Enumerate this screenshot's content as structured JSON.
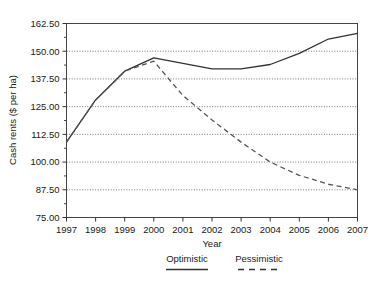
{
  "chart_data": {
    "type": "line",
    "title": "",
    "xlabel": "Year",
    "ylabel": "Cash rents ($ per ha)",
    "x": [
      1997,
      1998,
      1999,
      2000,
      2001,
      2002,
      2003,
      2004,
      2005,
      2006,
      2007
    ],
    "xticklabels": [
      "1997",
      "1998",
      "1999",
      "2000",
      "2001",
      "2002",
      "2003",
      "2004",
      "2005",
      "2006",
      "2007"
    ],
    "yticklabels": [
      "162.50",
      "150.00",
      "137.50",
      "125.00",
      "112.50",
      "100.00",
      "87.50",
      "75.00"
    ],
    "yticks": [
      162.5,
      150.0,
      137.5,
      125.0,
      112.5,
      100.0,
      87.5,
      75.0
    ],
    "ylim": [
      75.0,
      162.5
    ],
    "xlim": [
      1997,
      2007
    ],
    "grid": "horizontal-dotted",
    "legend_position": "below-axis",
    "series": [
      {
        "name": "Optimistic",
        "style": "solid",
        "color": "#333333",
        "values": [
          109.0,
          128.0,
          141.0,
          147.0,
          144.5,
          142.0,
          142.0,
          144.0,
          149.0,
          155.5,
          158.0
        ]
      },
      {
        "name": "Pessimistic",
        "style": "dashed",
        "color": "#555555",
        "values": [
          109.0,
          128.0,
          141.0,
          145.5,
          130.0,
          119.0,
          109.0,
          100.0,
          94.0,
          90.0,
          87.5
        ]
      }
    ]
  },
  "legend": {
    "items": [
      {
        "label": "Optimistic",
        "style": "solid"
      },
      {
        "label": "Pessimistic",
        "style": "dashed"
      }
    ]
  }
}
